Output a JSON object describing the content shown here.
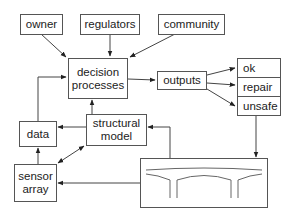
{
  "diagram": {
    "stakeholders": [
      {
        "id": "owner",
        "label": "owner"
      },
      {
        "id": "regulators",
        "label": "regulators"
      },
      {
        "id": "community",
        "label": "community"
      }
    ],
    "decision": {
      "line1": "decision",
      "line2": "processes"
    },
    "outputs": {
      "label": "outputs"
    },
    "outcomes": [
      {
        "id": "ok",
        "label": "ok"
      },
      {
        "id": "repair",
        "label": "repair"
      },
      {
        "id": "unsafe",
        "label": "unsafe"
      }
    ],
    "data": {
      "label": "data"
    },
    "structural_model": {
      "line1": "structural",
      "line2": "model"
    },
    "sensor_array": {
      "line1": "sensor",
      "line2": "array"
    },
    "bridge": {
      "icon": "bridge-icon"
    },
    "edges": [
      {
        "from": "owner",
        "to": "decision processes"
      },
      {
        "from": "regulators",
        "to": "decision processes"
      },
      {
        "from": "community",
        "to": "decision processes"
      },
      {
        "from": "data",
        "to": "decision processes"
      },
      {
        "from": "structural model",
        "to": "decision processes"
      },
      {
        "from": "decision processes",
        "to": "outputs"
      },
      {
        "from": "outputs",
        "to": "ok"
      },
      {
        "from": "outputs",
        "to": "repair"
      },
      {
        "from": "outputs",
        "to": "unsafe"
      },
      {
        "from": "unsafe",
        "to": "bridge"
      },
      {
        "from": "structural model",
        "to": "data"
      },
      {
        "from": "sensor array",
        "to": "data"
      },
      {
        "from": "structural model",
        "to": "sensor array",
        "bidirectional": true
      },
      {
        "from": "bridge",
        "to": "structural model"
      },
      {
        "from": "bridge",
        "to": "sensor array"
      }
    ]
  }
}
